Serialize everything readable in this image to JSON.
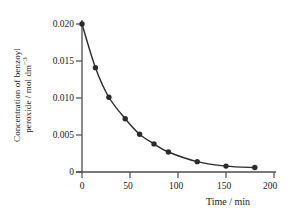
{
  "chart_data": {
    "type": "scatter",
    "title": "",
    "subtitle": "",
    "xlabel": "Time / min",
    "ylabel_line1": "Concentration of benzoyl",
    "ylabel_line2": "peroxide / mol dm",
    "ylabel_exponent": "−3",
    "xlim": [
      0,
      200
    ],
    "ylim": [
      0,
      0.0205
    ],
    "xticks": [
      "0",
      "50",
      "100",
      "150",
      "200"
    ],
    "xtick_values": [
      0,
      50,
      100,
      150,
      200
    ],
    "yticks": [
      "0",
      "0.005",
      "0.010",
      "0.015",
      "0.020"
    ],
    "ytick_values": [
      0,
      0.005,
      0.01,
      0.015,
      0.02
    ],
    "grid": false,
    "legend": "none",
    "marker": "filled-circle",
    "marker_color": "#2b2b2b",
    "line_color": "#2b2b2b",
    "axis_color": "#4d4d4d",
    "x": [
      0,
      14,
      28,
      45,
      60,
      75,
      90,
      120,
      150,
      180
    ],
    "values": [
      0.02,
      0.0141,
      0.0101,
      0.0072,
      0.0051,
      0.0038,
      0.0027,
      0.0014,
      0.0008,
      0.0006
    ],
    "series": [
      {
        "name": "benzoyl peroxide",
        "x": [
          0,
          14,
          28,
          45,
          60,
          75,
          90,
          120,
          150,
          180
        ],
        "values": [
          0.02,
          0.0141,
          0.0101,
          0.0072,
          0.0051,
          0.0038,
          0.0027,
          0.0014,
          0.0008,
          0.0006
        ]
      }
    ]
  }
}
